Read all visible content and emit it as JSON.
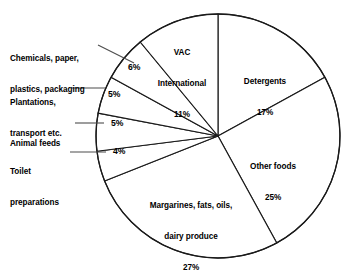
{
  "chart_data": {
    "type": "pie",
    "title": "",
    "xlabel": "",
    "ylabel": "",
    "legend_position": "none",
    "grid": false,
    "units": "percent",
    "total": 100,
    "start_angle_deg": 0,
    "direction": "clockwise",
    "categories": [
      "Detergents",
      "Other foods",
      "Margarines, fats, oils, dairy produce",
      "Toilet preparations",
      "Animal feeds",
      "Plantations, transport etc.",
      "Chemicals, paper, plastics, packaging",
      "VAC International"
    ],
    "values": [
      17,
      25,
      27,
      4,
      5,
      5,
      6,
      11
    ],
    "slices": [
      {
        "id": "detergents",
        "label": "Detergents",
        "label_line1": "Detergents",
        "label_line2": "17%",
        "value": 17,
        "percent_text": "17%",
        "label_placement": "inside",
        "label_x": 264,
        "label_y": 62
      },
      {
        "id": "other-foods",
        "label": "Other foods",
        "label_line1": "Other foods",
        "label_line2": "25%",
        "value": 25,
        "percent_text": "25%",
        "label_placement": "inside",
        "label_x": 272,
        "label_y": 146
      },
      {
        "id": "margarines",
        "label": "Margarines, fats, oils, dairy produce",
        "label_line1": "Margarines, fats, oils,",
        "label_line2": "dairy produce",
        "label_line3": "27%",
        "value": 27,
        "percent_text": "27%",
        "label_placement": "inside",
        "label_x": 190,
        "label_y": 186
      },
      {
        "id": "toilet-preparations",
        "label": "Toilet preparations",
        "label_line1": "Toilet",
        "label_line2": "preparations",
        "value": 4,
        "percent_text": "4%",
        "label_placement": "outside",
        "label_x": 10,
        "label_y": 145,
        "pct_x": 113,
        "pct_y": 149,
        "leader": {
          "x1": 70,
          "y1": 152,
          "x2": 106,
          "y2": 152
        }
      },
      {
        "id": "animal-feeds",
        "label": "Animal feeds",
        "label_line1": "Animal feeds",
        "value": 5,
        "percent_text": "5%",
        "label_placement": "outside",
        "label_x": 10,
        "label_y": 119,
        "pct_x": 111,
        "pct_y": 119,
        "leader": {
          "x1": 75,
          "y1": 123,
          "x2": 104,
          "y2": 123
        }
      },
      {
        "id": "plantations",
        "label": "Plantations, transport etc.",
        "label_line1": "Plantations,",
        "label_line2": "transport etc.",
        "value": 5,
        "percent_text": "5%",
        "label_placement": "outside",
        "label_x": 10,
        "label_y": 81,
        "pct_x": 108,
        "pct_y": 93,
        "leader": {
          "x1": 72,
          "y1": 88,
          "x2": 105,
          "y2": 88
        }
      },
      {
        "id": "chemicals",
        "label": "Chemicals, paper, plastics, packaging",
        "label_line1": "Chemicals, paper,",
        "label_line2": "plastics, packaging",
        "value": 6,
        "percent_text": "6%",
        "label_placement": "outside",
        "label_x": 10,
        "label_y": 37,
        "pct_x": 131,
        "pct_y": 66,
        "leader": {
          "x1": 98,
          "y1": 45,
          "x2": 134,
          "y2": 63
        }
      },
      {
        "id": "vac-international",
        "label": "VAC International",
        "label_line1": "VAC",
        "label_line2": "International",
        "label_line3": "11%",
        "value": 11,
        "percent_text": "11%",
        "label_placement": "inside",
        "label_x": 182,
        "label_y": 33
      }
    ],
    "geometry": {
      "center_x": 218,
      "center_y": 136,
      "radius": 122
    },
    "colors": {
      "outline": "#1a1a1a",
      "fill": "#ffffff",
      "leader": "#4d4d4d",
      "text": "#000000"
    }
  }
}
